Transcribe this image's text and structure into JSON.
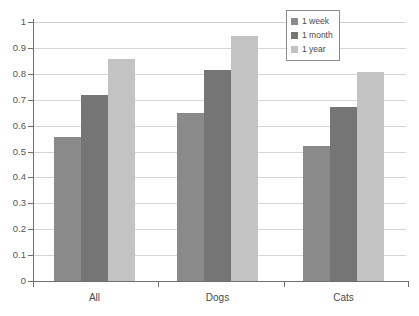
{
  "chart_data": {
    "type": "bar",
    "title": "",
    "xlabel": "",
    "ylabel": "",
    "categories": [
      "All",
      "Dogs",
      "Cats"
    ],
    "series": [
      {
        "name": "1 week",
        "color": "#8a8a8a",
        "values": [
          0.555,
          0.65,
          0.52
        ]
      },
      {
        "name": "1 month",
        "color": "#757575",
        "values": [
          0.72,
          0.815,
          0.672
        ]
      },
      {
        "name": "1 year",
        "color": "#c3c3c3",
        "values": [
          0.857,
          0.945,
          0.808
        ]
      }
    ],
    "ylim": [
      0,
      1
    ],
    "ytick_labels": [
      "1",
      "0.9",
      "0.8",
      "0.7",
      "0.6",
      "0.5",
      "0.4",
      "0.3",
      "0.2",
      "0.1",
      "0"
    ],
    "ytick_values": [
      1,
      0.9,
      0.8,
      0.7,
      0.6,
      0.5,
      0.4,
      0.3,
      0.2,
      0.1,
      0
    ],
    "grid": true,
    "legend_position": "top-right",
    "legend_entries": [
      "1 week",
      "1 month",
      "1 year"
    ]
  },
  "legend": {
    "items": [
      {
        "label": "1 week"
      },
      {
        "label": "1 month"
      },
      {
        "label": "1 year"
      }
    ]
  },
  "axes": {
    "x_labels": [
      "All",
      "Dogs",
      "Cats"
    ],
    "y_labels": [
      "1",
      "0.9",
      "0.8",
      "0.7",
      "0.6",
      "0.5",
      "0.4",
      "0.3",
      "0.2",
      "0.1",
      "0"
    ]
  },
  "colors": {
    "series_1_week": "#8a8a8a",
    "series_1_month": "#757575",
    "series_1_year": "#c3c3c3",
    "axis": "#6f6f6f",
    "grid": "#d6d6d6",
    "background": "#ffffff",
    "text": "#4a4a4a"
  }
}
